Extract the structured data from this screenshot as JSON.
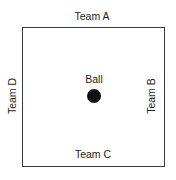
{
  "diagram": {
    "type": "field-layout",
    "teams": {
      "top": "Team A",
      "right": "Team B",
      "bottom": "Team C",
      "left": "Team D"
    },
    "center": {
      "label": "Ball",
      "shape": "filled-circle",
      "color": "#111111"
    },
    "border_color": "#3a3a3a"
  }
}
